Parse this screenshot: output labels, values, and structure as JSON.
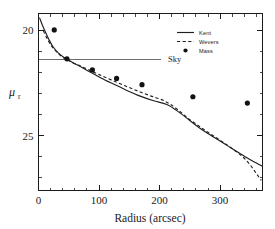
{
  "chart_data": {
    "type": "line",
    "title": "",
    "xlabel": "Radius (arcsec)",
    "ylabel": "μ_r",
    "ylabel_base": "μ",
    "ylabel_subscript": "r",
    "xlim": [
      0,
      370
    ],
    "ylim": [
      27.6,
      19.2
    ],
    "y_inverted": true,
    "grid": false,
    "xticks": [
      0,
      100,
      200,
      300
    ],
    "xtick_labels": [
      "0",
      "100",
      "200",
      "300"
    ],
    "yticks": [
      20,
      25
    ],
    "ytick_labels": [
      "20",
      "25"
    ],
    "x_minor_tick_step": 20,
    "y_minor_tick_step": 1,
    "legend_position": "top-right",
    "annotations": [
      {
        "name": "sky-level",
        "label": "Sky",
        "y_value": 21.37,
        "x_start": 0,
        "x_end": 202,
        "label_x": 214,
        "color": "#6d6d6d"
      }
    ],
    "series": [
      {
        "name": "Kent",
        "style": "solid",
        "color": "#1f1f1f",
        "x": [
          2,
          6,
          11,
          17,
          24,
          33,
          44,
          56,
          70,
          86,
          104,
          124,
          146,
          168,
          190,
          212,
          232,
          250,
          266,
          282,
          298,
          312,
          326,
          340,
          352,
          362,
          370
        ],
        "y": [
          19.42,
          19.72,
          20.05,
          20.42,
          20.78,
          21.08,
          21.32,
          21.52,
          21.73,
          21.99,
          22.27,
          22.55,
          22.85,
          23.12,
          23.34,
          23.52,
          23.88,
          24.28,
          24.63,
          24.93,
          25.22,
          25.47,
          25.73,
          25.97,
          26.18,
          26.33,
          26.45
        ]
      },
      {
        "name": "Wevers",
        "style": "dashed",
        "color": "#1f1f1f",
        "x": [
          8,
          14,
          21,
          30,
          40,
          52,
          66,
          82,
          100,
          120,
          142,
          164,
          186,
          208,
          228,
          246,
          264,
          280,
          296,
          310,
          324,
          338,
          350,
          360,
          368
        ],
        "y": [
          20.02,
          20.38,
          20.72,
          21.02,
          21.28,
          21.47,
          21.65,
          21.86,
          22.1,
          22.35,
          22.62,
          22.88,
          23.12,
          23.35,
          23.72,
          24.15,
          24.52,
          24.84,
          25.14,
          25.41,
          25.7,
          26.02,
          26.4,
          26.8,
          27.12
        ]
      },
      {
        "name": "Mass",
        "style": "points",
        "marker": "filled-circle",
        "color": "#121212",
        "x": [
          26,
          47,
          89,
          129,
          171,
          255,
          345
        ],
        "y": [
          19.98,
          21.35,
          21.88,
          22.28,
          22.58,
          23.15,
          23.45
        ]
      }
    ],
    "legend_entries": [
      {
        "label": "Kent",
        "style": "solid"
      },
      {
        "label": "Wevers",
        "style": "dashed"
      },
      {
        "label": "Mass",
        "style": "marker"
      }
    ]
  }
}
